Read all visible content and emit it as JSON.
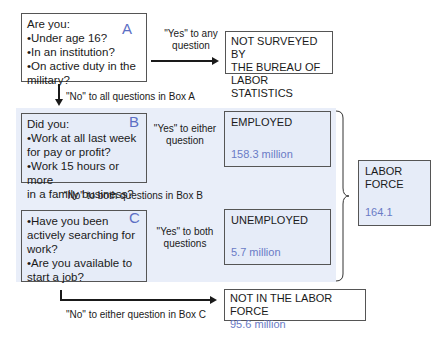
{
  "box_a": {
    "letter": "A",
    "lines": [
      "Are you:",
      "•Under age 16?",
      "•In an institution?",
      "•On active duty in the",
      "military?"
    ]
  },
  "box_a_yes_label": [
    "\"Yes\" to any",
    "question"
  ],
  "not_surveyed": {
    "lines": [
      "NOT SURVEYED BY",
      "THE BUREAU OF",
      "LABOR STATISTICS"
    ]
  },
  "box_a_no_label": "\"No\" to all questions in Box A",
  "box_b": {
    "letter": "B",
    "lines": [
      "Did you:",
      "•Work at all last week",
      "for pay or profit?",
      "•Work 15 hours or more",
      "in a family business?"
    ]
  },
  "box_b_yes_label": [
    "\"Yes\" to either",
    "question"
  ],
  "employed": {
    "title": "EMPLOYED",
    "value": "158.3 million"
  },
  "box_b_no_label": "\"No\" to both questions in Box B",
  "box_c": {
    "letter": "C",
    "lines": [
      "•Have you been",
      "actively searching for",
      "work?",
      "•Are you available to",
      "start a job?"
    ]
  },
  "box_c_yes_label": [
    "\"Yes\" to both",
    "questions"
  ],
  "unemployed": {
    "title": "UNEMPLOYED",
    "value": "5.7 million"
  },
  "labor_force": {
    "title_lines": [
      "LABOR",
      "FORCE"
    ],
    "value": "164.1"
  },
  "box_c_no_label": "\"No\" to either question in Box C",
  "not_in_labor_force": {
    "title": "NOT IN THE LABOR FORCE",
    "value": "95.6 million"
  },
  "colors": {
    "accent_blue": "#6a7bc6",
    "panel": "#e9eef9",
    "border": "#555555"
  }
}
